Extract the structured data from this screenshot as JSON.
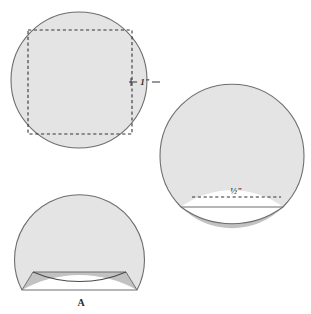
{
  "sheet": {
    "title": "Geometric circle segment diagrams",
    "background_color": "#ffffff"
  },
  "colors": {
    "body_fill": "#e4e4e4",
    "segment_fill": "#c2c2c2",
    "outline": "#6e6e6e",
    "dashed_line": "#333333",
    "label_text": "#2b2b2b"
  },
  "figures": [
    {
      "id": "figure-top-left",
      "name": "circle-with-inscribed-square",
      "description": "Full circle containing a dashed inscribed square",
      "center": {
        "x": 79,
        "y": 80
      },
      "radius": 68,
      "square": {
        "x": 28,
        "y": 30,
        "width": 104,
        "height": 104
      },
      "dimension_label": "1\"",
      "dimension_label_pos": {
        "x": 145,
        "y": 82
      }
    },
    {
      "id": "figure-right",
      "name": "truncated-circle-with-segment",
      "description": "Circle cut flat at bottom with a darker circular segment and a dashed chord",
      "center": {
        "x": 232,
        "y": 155
      },
      "radius": 72,
      "flat_cut_y": 207,
      "arc_bulge_y": 185,
      "dashed_chord_y": 197,
      "dimension_label": "½\"",
      "dimension_label_pos": {
        "x": 235,
        "y": 194
      }
    },
    {
      "id": "figure-bottom-left",
      "name": "truncated-circle-with-chord-wedges",
      "description": "Circle cut flat at bottom with a horizontal chord and a downward arc forming two darker wedges",
      "center": {
        "x": 79,
        "y": 232
      },
      "radius": 65,
      "flat_cut_y": 290,
      "chord_y": 272,
      "arc_dip_y": 288,
      "point_label": "A",
      "point_label_pos": {
        "x": 81,
        "y": 304
      }
    }
  ]
}
